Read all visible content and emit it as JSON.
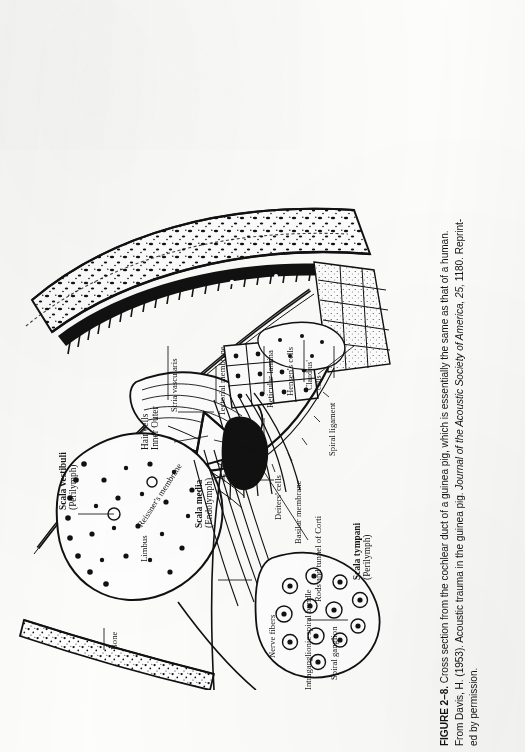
{
  "page": {
    "kind": "scanned-textbook-figure-page",
    "background_hex": "#fdfdfc",
    "ink_hex": "#131313"
  },
  "caption": {
    "figure_label": "FIGURE 2–8.",
    "lines": [
      {
        "segments": [
          {
            "text": "FIGURE 2–8.",
            "style": "bold"
          },
          {
            "text": "  Cross section from the cochlear duct of a guinea pig, which is essentially the same as that of a human.",
            "style": "regular"
          }
        ]
      },
      {
        "segments": [
          {
            "text": "From Davis, H. (1953). Acoustic trauma in the guinea pig. ",
            "style": "regular"
          },
          {
            "text": "Journal of the Acoustic Society of America, 25,",
            "style": "italic"
          },
          {
            "text": " 1180. Reprint-",
            "style": "regular"
          }
        ]
      },
      {
        "segments": [
          {
            "text": "ed by permission.",
            "style": "regular"
          }
        ]
      }
    ],
    "plain_text": "FIGURE 2–8. Cross section from the cochlear duct of a guinea pig, which is essentially the same as that of a human. From Davis, H. (1953). Acoustic trauma in the guinea pig. Journal of the Acoustic Society of America, 25, 1180. Reprinted by permission.",
    "citation": {
      "author": "Davis, H.",
      "year": "1953",
      "article": "Acoustic trauma in the guinea pig",
      "journal": "Journal of the Acoustic Society of America",
      "volume": "25",
      "page": "1180"
    }
  },
  "figure": {
    "orientation_note": "plate printed sideways; labels read bottom-to-top",
    "labels": [
      {
        "id": "scala-vestibuli",
        "line1": "Scala vestibuli",
        "line2": "(Perilymph)",
        "weight": "bold"
      },
      {
        "id": "bone",
        "line1": "Bone",
        "line2": "",
        "weight": "regular"
      },
      {
        "id": "reissners-membrane",
        "line1": "Reissner's membrane",
        "line2": "",
        "weight": "regular"
      },
      {
        "id": "stria-vascularis",
        "line1": "Stria vascularis",
        "line2": "",
        "weight": "regular"
      },
      {
        "id": "scala-media",
        "line1": "Scala media",
        "line2": "(Endolymph)",
        "weight": "bold"
      },
      {
        "id": "tectorial-membrane",
        "line1": "Tectorial membrane",
        "line2": "",
        "weight": "regular"
      },
      {
        "id": "reticular-lamina",
        "line1": "Reticular lamina",
        "line2": "",
        "weight": "regular"
      },
      {
        "id": "hensens-cells",
        "line1": "Hensen's cells",
        "line2": "",
        "weight": "regular"
      },
      {
        "id": "claudius-cells",
        "line1": "Claudius'",
        "line2": "cells",
        "weight": "regular"
      },
      {
        "id": "deiters-cells",
        "line1": "Deiters' cells",
        "line2": "",
        "weight": "regular"
      },
      {
        "id": "basilar-membrane",
        "line1": "Basilar membrane",
        "line2": "",
        "weight": "regular"
      },
      {
        "id": "spiral-ligament",
        "line1": "Spiral ligament",
        "line2": "",
        "weight": "regular"
      },
      {
        "id": "hair-cells",
        "line1": "Hair cells",
        "line2": "Inner Outer",
        "weight": "bold"
      },
      {
        "id": "rods-tunnel-corti",
        "line1": "Rods and tunnel of Corti",
        "line2": "",
        "weight": "regular"
      },
      {
        "id": "scala-tympani",
        "line1": "Scala tympani",
        "line2": "(Perilymph)",
        "weight": "bold"
      },
      {
        "id": "nerve-fibers",
        "line1": "Nerve fibers",
        "line2": "",
        "weight": "regular"
      },
      {
        "id": "intraganglionic-spiral-bundle",
        "line1": "Intraganglionic spiral bundle",
        "line2": "",
        "weight": "regular"
      },
      {
        "id": "spiral-ganglion",
        "line1": "Spiral ganglion",
        "line2": "",
        "weight": "regular"
      },
      {
        "id": "limbus",
        "line1": "Limbus",
        "line2": "",
        "weight": "regular"
      }
    ]
  }
}
